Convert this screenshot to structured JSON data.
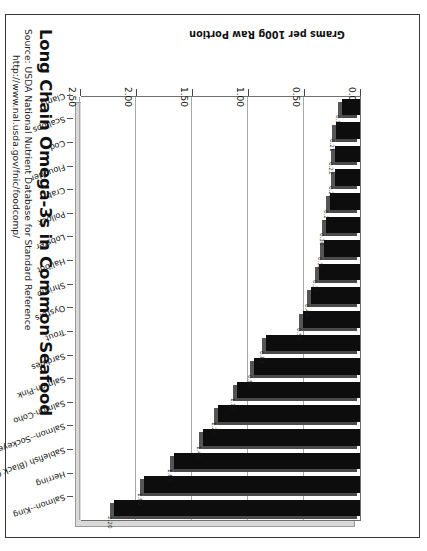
{
  "chart_data": {
    "type": "bar",
    "orientation": "horizontal",
    "title": "Long Chain Omega-3s in Common Seafood",
    "subtitle_lines": [
      "Source: USDA National Nutrient Database for Standard Reference",
      "http://www.nal.usda.gov/fnic/foodcomp/"
    ],
    "xlabel": "Grams per 100g Raw Portion",
    "ylabel": "",
    "xlim": [
      0,
      2.5
    ],
    "xticks": [
      "0.00",
      "0.50",
      "1.00",
      "1.50",
      "2.00",
      "2.50"
    ],
    "xtick_values": [
      0,
      0.5,
      1.0,
      1.5,
      2.0,
      2.5
    ],
    "grid": true,
    "legend": false,
    "bar_color": "#0d0d0d",
    "categories": [
      "Salmon--King",
      "Herring",
      "Sablefish (Black Cod)",
      "Salmon--Sockeye",
      "Salmon-Coho",
      "Salmon-Pink",
      "Sardines",
      "Trout",
      "Oysters",
      "Shrimp",
      "Halibut",
      "Lobster",
      "Pollock",
      "Crab",
      "Flounder",
      "Cod",
      "Scallops",
      "Clams"
    ],
    "values": [
      2.2,
      1.93,
      1.66,
      1.4,
      1.27,
      1.1,
      0.95,
      0.84,
      0.51,
      0.44,
      0.37,
      0.32,
      0.3,
      0.27,
      0.22,
      0.22,
      0.21,
      0.16
    ],
    "value_labels": [
      "2.20",
      "1.93",
      "1.66",
      "1.40",
      "1.27",
      "1.10",
      "0.95",
      "0.84",
      "0.51",
      "0.44",
      "0.37",
      "0.32",
      "0.30",
      "0.27",
      "0.22",
      "0.22",
      "0.21",
      "0.16"
    ]
  }
}
